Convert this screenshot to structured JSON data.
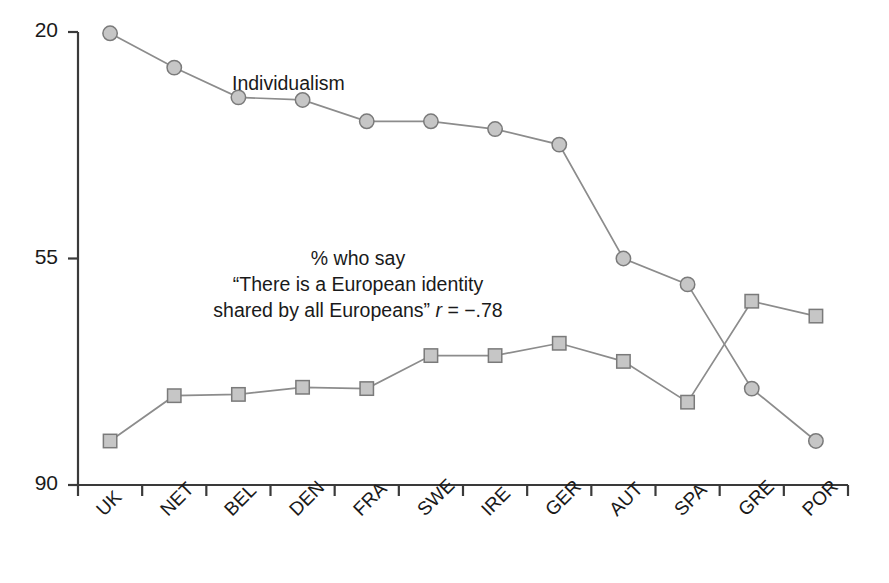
{
  "chart_data": {
    "type": "line",
    "title": "",
    "subtitle": "",
    "xlabel": "",
    "ylabel": "",
    "ylim": [
      20,
      90
    ],
    "yticks": [
      20,
      55,
      90
    ],
    "grid": false,
    "legend_position": "inline-annotation",
    "categories": [
      "UK",
      "NET",
      "BEL",
      "DEN",
      "FRA",
      "SWE",
      "IRE",
      "GER",
      "AUT",
      "SPA",
      "GRE",
      "POR"
    ],
    "series": [
      {
        "name": "Individualism",
        "marker": "circle",
        "values": [
          89.8,
          84.5,
          79.9,
          79.5,
          76.2,
          76.2,
          75.0,
          72.6,
          55.0,
          51.0,
          34.9,
          26.8
        ]
      },
      {
        "name": "% who say “There is a European identity shared by all Europeans”",
        "marker": "square",
        "values": [
          26.8,
          33.8,
          34.0,
          35.1,
          34.9,
          40.0,
          40.0,
          41.9,
          39.1,
          32.8,
          48.4,
          46.1
        ]
      }
    ],
    "annotations": [
      {
        "id": "individualism-label",
        "text": "Individualism"
      },
      {
        "id": "identity-label",
        "line1": "% who say",
        "line2": "“There is a European identity",
        "line3_text": "shared by all Europeans”",
        "line3_stat_symbol": "r",
        "line3_stat_value": " = −.78"
      }
    ],
    "colors": {
      "line": "#8c8c8c",
      "marker_fill": "#c6c6c6",
      "marker_stroke": "#7a7a7a",
      "axis": "#3a3a3a",
      "text": "#1a1a1a",
      "background": "#ffffff"
    }
  },
  "axes": {
    "y": {
      "ticks": [
        "90",
        "55",
        "20"
      ]
    },
    "x": {
      "labels": [
        "UK",
        "NET",
        "BEL",
        "DEN",
        "FRA",
        "SWE",
        "IRE",
        "GER",
        "AUT",
        "SPA",
        "GRE",
        "POR"
      ]
    }
  }
}
